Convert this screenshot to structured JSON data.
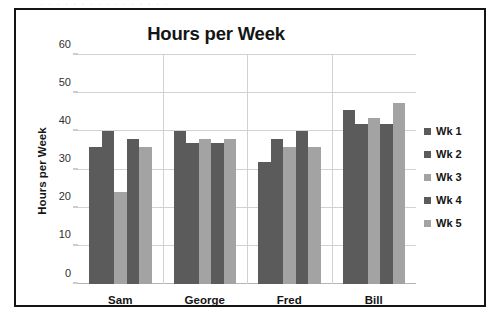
{
  "scan_artifact": {
    "top_text": "·  ·   ·  ·    ·  ·   ·   ·  ·    ·   ·   ·  ·   ·   ·  ·"
  },
  "chart_data": {
    "type": "bar",
    "title": "Hours per Week",
    "xlabel": "",
    "ylabel": "Hours per Week",
    "categories": [
      "Sam",
      "George",
      "Fred",
      "Bill"
    ],
    "series": [
      {
        "name": "Wk 1",
        "color": "#5b5b5b",
        "values": [
          36,
          40,
          32,
          45.5
        ]
      },
      {
        "name": "Wk 2",
        "color": "#5b5b5b",
        "values": [
          40,
          37,
          38,
          42
        ]
      },
      {
        "name": "Wk 3",
        "color": "#a3a3a3",
        "values": [
          24,
          38,
          36,
          43.5
        ]
      },
      {
        "name": "Wk 4",
        "color": "#5b5b5b",
        "values": [
          38,
          37,
          40,
          42
        ]
      },
      {
        "name": "Wk 5",
        "color": "#a3a3a3",
        "values": [
          36,
          38,
          36,
          47.5
        ]
      }
    ],
    "ylim": [
      0,
      60
    ],
    "yticks": [
      0,
      10,
      20,
      30,
      40,
      50,
      60
    ],
    "ytick_labels": [
      "0",
      "10",
      "20",
      "30",
      "40",
      "50",
      "60"
    ],
    "grid": true,
    "legend_position": "right",
    "legend_entries": [
      "Wk 1",
      "Wk 2",
      "Wk 3",
      "Wk 4",
      "Wk 5"
    ]
  }
}
